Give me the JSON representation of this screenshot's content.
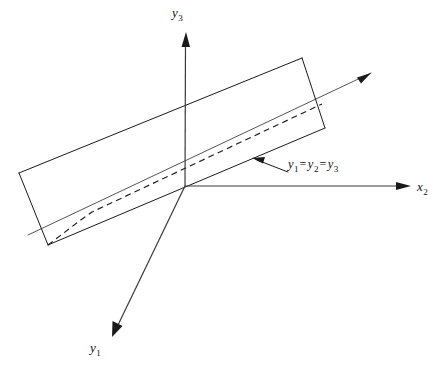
{
  "figure": {
    "domain": "diagram",
    "kind": "3d-coordinate-axes-with-slab",
    "background_color": "#ffffff",
    "line_color": "#1a1a1a",
    "width": 445,
    "height": 371
  },
  "axes": [
    {
      "id": "y3",
      "name": "y3-axis",
      "label_base": "y",
      "label_sub": "3",
      "direction": "up",
      "origin": [
        185,
        186
      ],
      "tip": [
        186,
        32
      ],
      "arrow": "solid"
    },
    {
      "id": "x2",
      "name": "x2-axis",
      "label_base": "x",
      "label_sub": "2",
      "direction": "right",
      "origin": [
        185,
        186
      ],
      "tip": [
        411,
        186
      ],
      "arrow": "solid"
    },
    {
      "id": "y1",
      "name": "y1-axis",
      "label_base": "y",
      "label_sub": "1",
      "direction": "down-left",
      "origin": [
        185,
        186
      ],
      "tip": [
        112,
        337
      ],
      "arrow": "solid"
    }
  ],
  "diagonal_line": {
    "name": "equal-coordinates-line",
    "label_parts": [
      "y",
      "1",
      "=",
      "y",
      "2",
      "=",
      "y",
      "3"
    ],
    "label_text": "y1 = y2 = y3",
    "start": [
      28,
      235
    ],
    "end": [
      371,
      73
    ],
    "arrow": "solid",
    "passes_through_origin": true
  },
  "annotation": {
    "name": "diagonal-callout",
    "leader_from": [
      288,
      172
    ],
    "leader_to": [
      253,
      159
    ],
    "arrow": "solid",
    "text_parts": [
      {
        "base": "y",
        "sub": "1"
      },
      {
        "eq": "="
      },
      {
        "base": "y",
        "sub": "2"
      },
      {
        "eq": "="
      },
      {
        "base": "y",
        "sub": "3"
      }
    ]
  },
  "slab": {
    "name": "constraint-slab",
    "description": "elongated parallelepiped plane slab crossing the origin",
    "top_far_edge": [
      [
        19,
        173
      ],
      [
        302,
        58
      ]
    ],
    "bottom_near_edge": [
      [
        48,
        245
      ],
      [
        325,
        128
      ]
    ],
    "left_face": [
      [
        19,
        173
      ],
      [
        302,
        58
      ],
      [
        325,
        128
      ],
      [
        48,
        245
      ]
    ],
    "right_face_edge": [
      [
        302,
        58
      ],
      [
        325,
        128
      ]
    ],
    "left_end_edge": [
      [
        19,
        173
      ],
      [
        48,
        245
      ]
    ]
  },
  "dashed_path": {
    "name": "kinked-dashed-curve",
    "points": [
      [
        48,
        245
      ],
      [
        78,
        222
      ],
      [
        92,
        212
      ],
      [
        322,
        104
      ]
    ],
    "style": "dashed"
  }
}
